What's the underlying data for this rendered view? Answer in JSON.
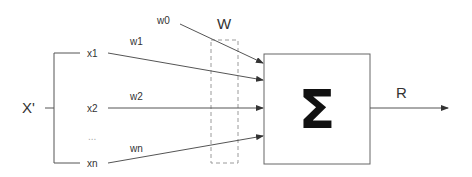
{
  "diagram": {
    "type": "perceptron weighted-sum diagram",
    "input_vector_label": "X'",
    "inputs": [
      {
        "label": "x1",
        "weight": "w1"
      },
      {
        "label": "x2",
        "weight": "w2"
      },
      {
        "label": "...",
        "weight": ""
      },
      {
        "label": "xn",
        "weight": "wn"
      }
    ],
    "bias_weight": "w0",
    "weight_group_label": "W",
    "summation_symbol": "Σ",
    "output_label": "R",
    "colors": {
      "line": "#555555",
      "dashed": "#9a9a9a",
      "text": "#333333",
      "sigma": "#111111",
      "background": "#ffffff"
    }
  }
}
